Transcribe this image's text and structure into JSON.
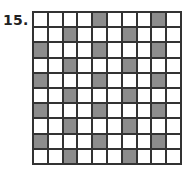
{
  "problem": {
    "number_label": "15."
  },
  "grid": {
    "rows": 10,
    "cols": 10,
    "shaded_color": "#8c8c8c",
    "shaded_cells": [
      [
        0,
        4
      ],
      [
        0,
        8
      ],
      [
        1,
        2
      ],
      [
        1,
        6
      ],
      [
        2,
        0
      ],
      [
        2,
        4
      ],
      [
        2,
        8
      ],
      [
        3,
        2
      ],
      [
        3,
        6
      ],
      [
        4,
        0
      ],
      [
        4,
        4
      ],
      [
        4,
        8
      ],
      [
        5,
        2
      ],
      [
        5,
        6
      ],
      [
        6,
        0
      ],
      [
        6,
        4
      ],
      [
        6,
        8
      ],
      [
        7,
        2
      ],
      [
        7,
        6
      ],
      [
        8,
        0
      ],
      [
        8,
        4
      ],
      [
        8,
        8
      ],
      [
        9,
        2
      ],
      [
        9,
        6
      ]
    ],
    "shaded_count": 24,
    "total_cells": 100
  }
}
